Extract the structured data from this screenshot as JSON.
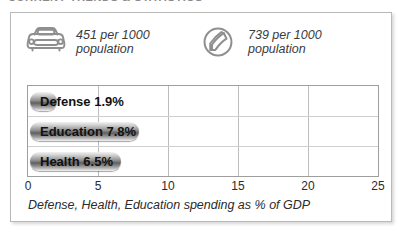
{
  "page": {
    "clipped_heading": "CURRENT TRENDS & STATISTICS"
  },
  "stats": [
    {
      "icon": "car-icon",
      "value": "451 per 1000",
      "unit": "population"
    },
    {
      "icon": "telephone-icon",
      "value": "739 per 1000",
      "unit": "population"
    }
  ],
  "chart_data": {
    "type": "bar",
    "orientation": "horizontal",
    "title": "",
    "caption": "Defense, Health, Education spending as % of GDP",
    "categories": [
      "Defense",
      "Education",
      "Health"
    ],
    "values": [
      1.9,
      7.8,
      6.5
    ],
    "value_labels": [
      "1.9%",
      "7.8%",
      "6.5%"
    ],
    "bar_labels": [
      "Defense 1.9%",
      "Education 7.8%",
      "Health 6.5%"
    ],
    "xlabel": "",
    "ylabel": "",
    "xlim": [
      0,
      25
    ],
    "xticks": [
      0,
      5,
      10,
      15,
      20,
      25
    ],
    "xtick_labels": [
      "0",
      "5",
      "10",
      "15",
      "20",
      "25"
    ],
    "grid": true,
    "legend": false,
    "colors": {
      "bar_dark": "#5f5f5f",
      "bar_light": "#f2f2f2",
      "grid": "#bdbdbd",
      "border": "#9e9e9e",
      "panel_border": "#b9b9b9",
      "icon": "#8c8c8c",
      "text": "#2b2b2b"
    }
  }
}
